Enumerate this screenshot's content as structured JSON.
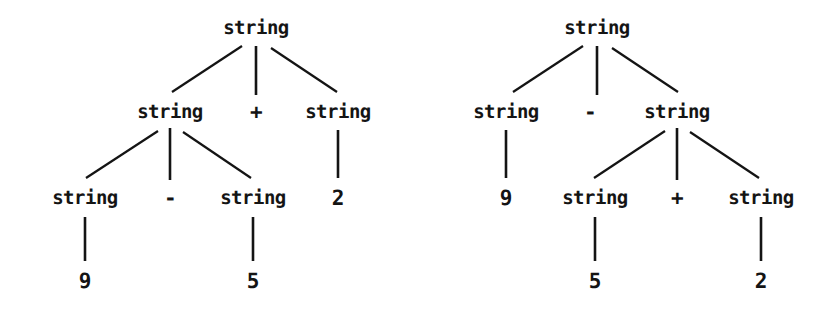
{
  "figure": {
    "background_color": "#ffffff",
    "ink_color": "#141414",
    "width": 835,
    "height": 317
  },
  "trees": [
    {
      "id": "left-tree",
      "description": "Parse tree with left-associative grouping: (9 - 5) + 2",
      "nodes": [
        {
          "id": "L0",
          "label": "string",
          "kind": "nonterminal",
          "x": 256,
          "y": 28,
          "level": 0
        },
        {
          "id": "L1",
          "label": "string",
          "kind": "nonterminal",
          "x": 170,
          "y": 112,
          "level": 1
        },
        {
          "id": "L2",
          "label": "+",
          "kind": "operator",
          "x": 256,
          "y": 112,
          "level": 1
        },
        {
          "id": "L3",
          "label": "string",
          "kind": "nonterminal",
          "x": 338,
          "y": 112,
          "level": 1
        },
        {
          "id": "L4",
          "label": "string",
          "kind": "nonterminal",
          "x": 85,
          "y": 198,
          "level": 2
        },
        {
          "id": "L5",
          "label": "-",
          "kind": "operator",
          "x": 170,
          "y": 198,
          "level": 2
        },
        {
          "id": "L6",
          "label": "string",
          "kind": "nonterminal",
          "x": 253,
          "y": 198,
          "level": 2
        },
        {
          "id": "L7",
          "label": "2",
          "kind": "terminal",
          "x": 338,
          "y": 198,
          "level": 2
        },
        {
          "id": "L8",
          "label": "9",
          "kind": "terminal",
          "x": 85,
          "y": 281,
          "level": 3
        },
        {
          "id": "L9",
          "label": "5",
          "kind": "terminal",
          "x": 253,
          "y": 281,
          "level": 3
        }
      ],
      "edges": [
        {
          "from": "L0",
          "to": "L1",
          "x1": 242,
          "y1": 46,
          "x2": 172,
          "y2": 92
        },
        {
          "from": "L0",
          "to": "L2",
          "x1": 256,
          "y1": 46,
          "x2": 256,
          "y2": 95
        },
        {
          "from": "L0",
          "to": "L3",
          "x1": 271,
          "y1": 48,
          "x2": 337,
          "y2": 92
        },
        {
          "from": "L1",
          "to": "L4",
          "x1": 158,
          "y1": 131,
          "x2": 86,
          "y2": 178
        },
        {
          "from": "L1",
          "to": "L5",
          "x1": 170,
          "y1": 128,
          "x2": 170,
          "y2": 180
        },
        {
          "from": "L1",
          "to": "L6",
          "x1": 183,
          "y1": 132,
          "x2": 251,
          "y2": 178
        },
        {
          "from": "L3",
          "to": "L7",
          "x1": 338,
          "y1": 130,
          "x2": 338,
          "y2": 178
        },
        {
          "from": "L4",
          "to": "L8",
          "x1": 85,
          "y1": 217,
          "x2": 85,
          "y2": 261
        },
        {
          "from": "L6",
          "to": "L9",
          "x1": 253,
          "y1": 217,
          "x2": 253,
          "y2": 261
        }
      ]
    },
    {
      "id": "right-tree",
      "description": "Parse tree with right-associative grouping: 9 - (5 + 2)",
      "nodes": [
        {
          "id": "R0",
          "label": "string",
          "kind": "nonterminal",
          "x": 597,
          "y": 28,
          "level": 0
        },
        {
          "id": "R1",
          "label": "string",
          "kind": "nonterminal",
          "x": 506,
          "y": 112,
          "level": 1
        },
        {
          "id": "R2",
          "label": "-",
          "kind": "operator",
          "x": 590,
          "y": 112,
          "level": 1
        },
        {
          "id": "R3",
          "label": "string",
          "kind": "nonterminal",
          "x": 677,
          "y": 112,
          "level": 1
        },
        {
          "id": "R4",
          "label": "9",
          "kind": "terminal",
          "x": 506,
          "y": 198,
          "level": 2
        },
        {
          "id": "R5",
          "label": "string",
          "kind": "nonterminal",
          "x": 595,
          "y": 198,
          "level": 2
        },
        {
          "id": "R6",
          "label": "+",
          "kind": "operator",
          "x": 677,
          "y": 198,
          "level": 2
        },
        {
          "id": "R7",
          "label": "string",
          "kind": "nonterminal",
          "x": 761,
          "y": 198,
          "level": 2
        },
        {
          "id": "R8",
          "label": "5",
          "kind": "terminal",
          "x": 595,
          "y": 281,
          "level": 3
        },
        {
          "id": "R9",
          "label": "2",
          "kind": "terminal",
          "x": 761,
          "y": 281,
          "level": 3
        }
      ],
      "edges": [
        {
          "from": "R0",
          "to": "R1",
          "x1": 583,
          "y1": 46,
          "x2": 513,
          "y2": 92
        },
        {
          "from": "R0",
          "to": "R2",
          "x1": 597,
          "y1": 46,
          "x2": 597,
          "y2": 95
        },
        {
          "from": "R0",
          "to": "R3",
          "x1": 612,
          "y1": 48,
          "x2": 678,
          "y2": 92
        },
        {
          "from": "R1",
          "to": "R4",
          "x1": 506,
          "y1": 130,
          "x2": 506,
          "y2": 178
        },
        {
          "from": "R3",
          "to": "R5",
          "x1": 665,
          "y1": 131,
          "x2": 594,
          "y2": 178
        },
        {
          "from": "R3",
          "to": "R6",
          "x1": 677,
          "y1": 128,
          "x2": 677,
          "y2": 180
        },
        {
          "from": "R3",
          "to": "R7",
          "x1": 690,
          "y1": 132,
          "x2": 759,
          "y2": 178
        },
        {
          "from": "R5",
          "to": "R8",
          "x1": 595,
          "y1": 217,
          "x2": 595,
          "y2": 261
        },
        {
          "from": "R7",
          "to": "R9",
          "x1": 761,
          "y1": 217,
          "x2": 761,
          "y2": 261
        }
      ]
    }
  ]
}
